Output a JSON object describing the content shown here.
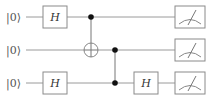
{
  "diagram": {
    "type": "quantum-circuit",
    "qubits": [
      {
        "label": "|0⟩",
        "y": 17
      },
      {
        "label": "|0⟩",
        "y": 50
      },
      {
        "label": "|0⟩",
        "y": 83
      }
    ],
    "gates": [
      {
        "type": "H",
        "label": "H",
        "qubit": 0,
        "x": 55
      },
      {
        "type": "H",
        "label": "H",
        "qubit": 2,
        "x": 55
      },
      {
        "type": "CNOT",
        "control": 0,
        "target": 1,
        "x": 91
      },
      {
        "type": "CZ",
        "qubits": [
          1,
          2
        ],
        "x": 115
      },
      {
        "type": "H",
        "label": "H",
        "qubit": 2,
        "x": 146
      },
      {
        "type": "measure",
        "qubit": 0,
        "x": 190
      },
      {
        "type": "measure",
        "qubit": 1,
        "x": 190
      },
      {
        "type": "measure",
        "qubit": 2,
        "x": 190
      }
    ]
  },
  "labels": {
    "q0": "|0⟩",
    "q1": "|0⟩",
    "q2": "|0⟩",
    "h1": "H",
    "h2": "H",
    "h3": "H"
  }
}
